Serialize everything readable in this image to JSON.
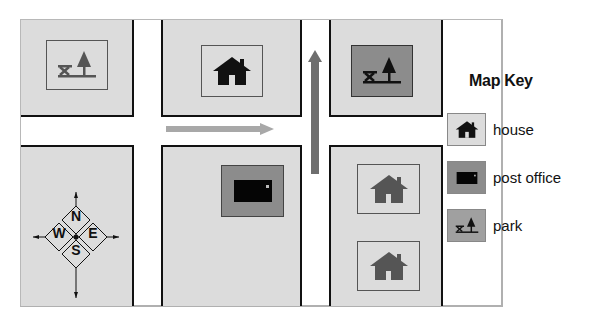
{
  "map": {
    "blocks": [
      {
        "id": "top-left",
        "feature": "park",
        "tile": "light"
      },
      {
        "id": "top-middle",
        "feature": "house",
        "tile": "light"
      },
      {
        "id": "top-right",
        "feature": "park",
        "tile": "dark"
      },
      {
        "id": "bottom-left",
        "feature": "compass-rose"
      },
      {
        "id": "bottom-middle",
        "feature": "post office",
        "tile": "dark"
      },
      {
        "id": "bottom-right-upper",
        "feature": "house",
        "tile": "light"
      },
      {
        "id": "bottom-right-lower",
        "feature": "house",
        "tile": "light"
      }
    ],
    "arrows": [
      {
        "id": "horizontal-road-arrow",
        "direction": "east",
        "color": "#a8a8a8"
      },
      {
        "id": "vertical-road-arrow",
        "direction": "north",
        "color": "#6e6e6e"
      }
    ],
    "compass": {
      "n": "N",
      "s": "S",
      "e": "E",
      "w": "W"
    }
  },
  "key": {
    "title": "Map Key",
    "items": [
      {
        "icon": "house-icon",
        "label": "house",
        "swatch": "#dcdcdc"
      },
      {
        "icon": "post-office-icon",
        "label": "post office",
        "swatch": "#8c8c8c"
      },
      {
        "icon": "park-icon",
        "label": "park",
        "swatch": "#a0a0a0"
      }
    ]
  },
  "colors": {
    "block": "#dcdcdc",
    "tile_dark": "#8c8c8c",
    "road": "#ffffff",
    "outline": "#111111"
  }
}
